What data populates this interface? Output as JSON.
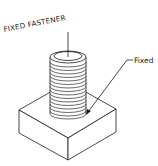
{
  "diagram": {
    "title_label": "FIXED FASTENER",
    "callout_label": "Fixed",
    "components": [
      "threaded-bolt",
      "rectangular-base-block"
    ],
    "colors": {
      "line": "#1a1a1a",
      "background": "#ffffff"
    }
  }
}
